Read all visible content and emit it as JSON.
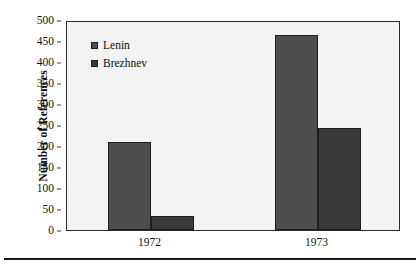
{
  "chart_data": {
    "type": "bar",
    "title": "",
    "subtitle": "",
    "xlabel": "",
    "ylabel": "Number of References",
    "categories": [
      "1972",
      "1973"
    ],
    "series": [
      {
        "name": "Lenin",
        "values": [
          210,
          465
        ],
        "color": "#4e4e4e"
      },
      {
        "name": "Brezhnev",
        "values": [
          33,
          243
        ],
        "color": "#3a3a3a"
      }
    ],
    "ylim": [
      0,
      500
    ],
    "ytick_step": 50,
    "yticks": [
      "0",
      "50",
      "100",
      "150",
      "200",
      "250",
      "300",
      "350",
      "400",
      "450",
      "500"
    ],
    "grid": false,
    "legend_position": "top-left",
    "annotations": []
  },
  "figure": {
    "plot_background": "#f3f3f3",
    "frame_color": "#2b2b2b",
    "page_background": "#ffffff",
    "rule_color": "#1a1a1a"
  },
  "legend": {
    "items": [
      {
        "label": "Lenin",
        "swatch_color": "#4e4e4e"
      },
      {
        "label": "Brezhnev",
        "swatch_color": "#3a3a3a"
      }
    ]
  }
}
